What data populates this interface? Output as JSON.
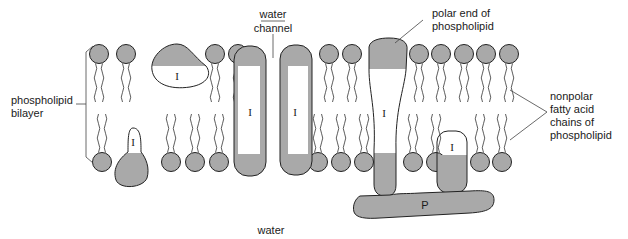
{
  "figure": {
    "type": "cell membrane fluid mosaic diagram",
    "colors": {
      "polar_fill": "#a9a9a9",
      "outline": "#222222",
      "background": "#ffffff"
    }
  },
  "labels": {
    "water_channel_line1": "water",
    "water_channel_line2": "channel",
    "polar_end_line1": "polar end of",
    "polar_end_line2": "phospholipid",
    "bilayer_line1": "phospholipid",
    "bilayer_line2": "bilayer",
    "nonpolar_line1": "nonpolar",
    "nonpolar_line2": "fatty acid",
    "nonpolar_line3": "chains of",
    "nonpolar_line4": "phospholipid",
    "water_bottom": "water"
  },
  "proteins": {
    "integral_label": "I",
    "peripheral_label": "P",
    "integral": [
      {
        "id": "i1",
        "label": "I",
        "position": "top leaflet, partially embedded"
      },
      {
        "id": "i2",
        "label": "I",
        "position": "bottom leaflet, partially embedded"
      },
      {
        "id": "i3",
        "label": "I",
        "position": "transmembrane, left of water channel"
      },
      {
        "id": "i4",
        "label": "I",
        "position": "transmembrane, right of water channel"
      },
      {
        "id": "i5",
        "label": "I",
        "position": "transmembrane, extends below membrane"
      },
      {
        "id": "i6",
        "label": "I",
        "position": "bottom leaflet, bound to peripheral protein"
      }
    ],
    "peripheral": [
      {
        "id": "p1",
        "label": "P",
        "position": "below membrane, attached to integral proteins"
      }
    ]
  },
  "phospholipids": {
    "top_heads_x": [
      99,
      126,
      215,
      238,
      329,
      352,
      419,
      441,
      464,
      486,
      509
    ],
    "bottom_heads_x": [
      102,
      171,
      195,
      219,
      318,
      341,
      364,
      413,
      436,
      480,
      502
    ],
    "top_y": 54,
    "bottom_y": 162,
    "radius": 9.5
  }
}
